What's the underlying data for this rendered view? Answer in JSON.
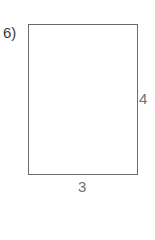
{
  "problem": {
    "number_label": "6)",
    "shape": "rectangle",
    "side_label": "4",
    "bottom_label": "3"
  },
  "colors": {
    "stroke": "#6b6b6b",
    "label_text": "#707070",
    "number_text": "#3a3a3a",
    "background": "#ffffff"
  }
}
